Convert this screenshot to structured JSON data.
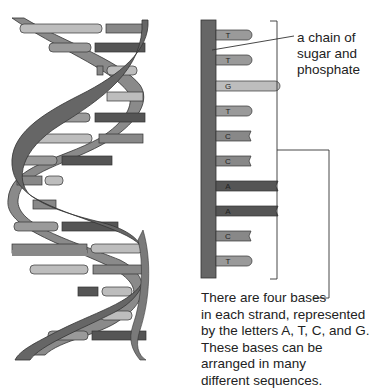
{
  "figure": {
    "colors": {
      "backbone": "#666666",
      "backbone_back": "#8a8a8a",
      "base_A": "#555555",
      "base_C": "#888888",
      "base_T": "#9a9a9a",
      "base_G": "#bdbdbd",
      "outline": "#333333"
    }
  },
  "strand": {
    "bases": [
      {
        "letter": "T",
        "y": 30,
        "length": 36
      },
      {
        "letter": "T",
        "y": 55,
        "length": 36
      },
      {
        "letter": "G",
        "y": 81,
        "length": 64
      },
      {
        "letter": "T",
        "y": 106,
        "length": 36
      },
      {
        "letter": "C",
        "y": 131,
        "length": 35
      },
      {
        "letter": "C",
        "y": 156,
        "length": 35
      },
      {
        "letter": "A",
        "y": 181,
        "length": 62
      },
      {
        "letter": "A",
        "y": 206,
        "length": 62
      },
      {
        "letter": "C",
        "y": 231,
        "length": 35
      },
      {
        "letter": "T",
        "y": 256,
        "length": 36
      }
    ]
  },
  "labels": {
    "chain": [
      "a chain of",
      "sugar and",
      "phosphate"
    ],
    "bases": [
      "There are four bases",
      "in each strand, represented",
      "by the letters A, T, C, and G.",
      "These bases can be",
      "arranged in many",
      "different sequences."
    ]
  }
}
